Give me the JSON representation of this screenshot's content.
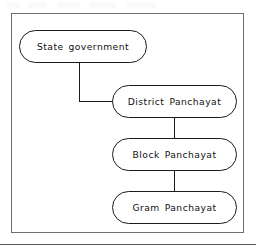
{
  "figure": {
    "type": "hierarchy-flowchart",
    "orientation": "top-to-bottom",
    "background_color": "#ffffff",
    "frame_color": "#6f6f6f",
    "node_border_color": "#1a1a1a",
    "connector_color": "#1a1a1a",
    "text_color": "#111111",
    "nodes": [
      {
        "id": "state",
        "label": "State government",
        "level": 0
      },
      {
        "id": "district",
        "label": "District Panchayat",
        "level": 1
      },
      {
        "id": "block",
        "label": "Block Panchayat",
        "level": 2
      },
      {
        "id": "gram",
        "label": "Gram Panchayat",
        "level": 3
      }
    ],
    "connectors": [
      {
        "id": "state-district",
        "from": "state",
        "to": "district",
        "style": "elbow"
      },
      {
        "id": "district-block",
        "from": "district",
        "to": "block",
        "style": "straight"
      },
      {
        "id": "block-gram",
        "from": "block",
        "to": "gram",
        "style": "straight"
      }
    ]
  }
}
